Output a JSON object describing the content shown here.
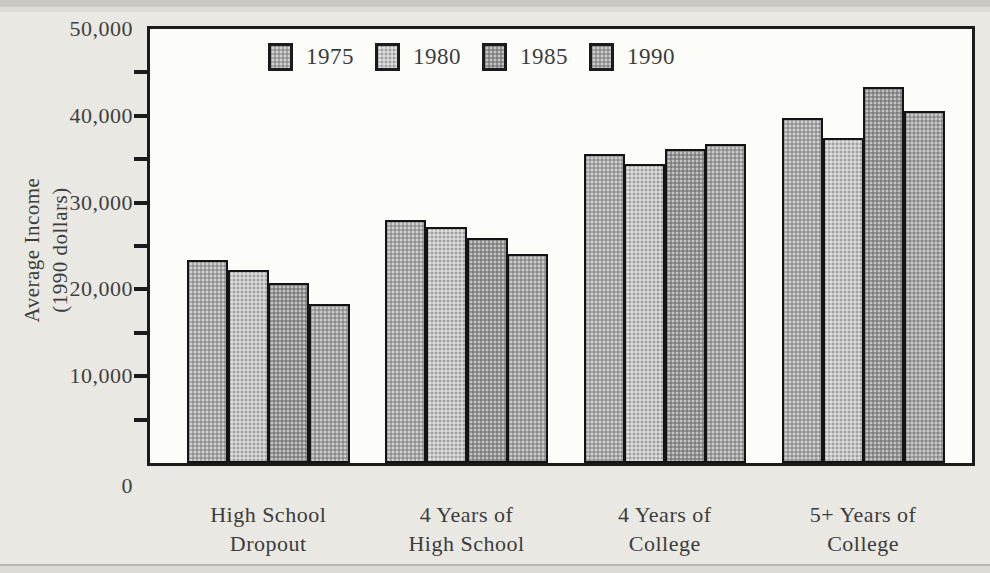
{
  "chart_data": {
    "type": "bar",
    "title": "",
    "ylabel_lines": [
      "Average Income",
      "(1990 dollars)"
    ],
    "xlabel": "",
    "categories": [
      [
        "High School",
        "Dropout"
      ],
      [
        "4 Years of",
        "High School"
      ],
      [
        "4 Years of",
        "College"
      ],
      [
        "5+ Years of",
        "College"
      ]
    ],
    "series": [
      {
        "name": "1975",
        "color": "#a9a9a9",
        "values": [
          23400,
          28000,
          35600,
          39800
        ]
      },
      {
        "name": "1980",
        "color": "#c4c4c4",
        "values": [
          22200,
          27200,
          34500,
          37400
        ]
      },
      {
        "name": "1985",
        "color": "#939393",
        "values": [
          20700,
          25900,
          36200,
          43300
        ]
      },
      {
        "name": "1990",
        "color": "#a2a2a2",
        "values": [
          18300,
          24100,
          36800,
          40500
        ]
      }
    ],
    "ylim": [
      0,
      50000
    ],
    "ytick_minor_step": 5000,
    "yticks": [
      {
        "value": 0,
        "label": "0"
      },
      {
        "value": 10000,
        "label": "10,000"
      },
      {
        "value": 20000,
        "label": "20,000"
      },
      {
        "value": 30000,
        "label": "30,000"
      },
      {
        "value": 40000,
        "label": "40,000"
      },
      {
        "value": 50000,
        "label": "50,000"
      }
    ],
    "legend_position": "top",
    "grid": "off",
    "colors": {
      "frame": "#1b1b1b",
      "plot_bg": "#fcfcf9",
      "page_bg": "#e9e8e3"
    }
  }
}
